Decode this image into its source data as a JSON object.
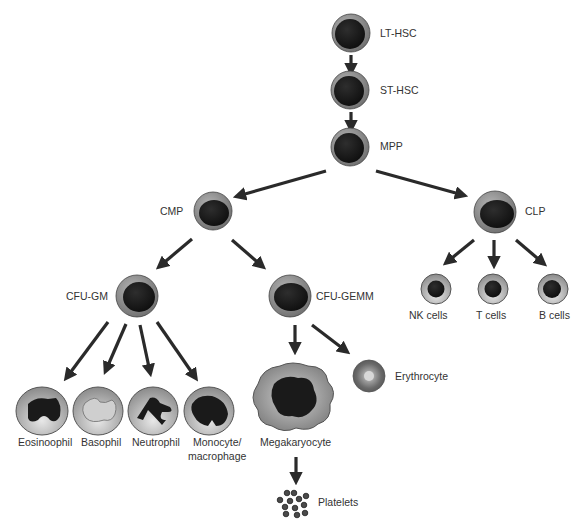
{
  "colors": {
    "arrow": "#2a2a2a",
    "cell_outer": "#7a7a7a",
    "cell_nucleus": "#1a1a1a",
    "label": "#333333"
  },
  "nodes": {
    "lt_hsc": {
      "label": "LT-HSC"
    },
    "st_hsc": {
      "label": "ST-HSC"
    },
    "mpp": {
      "label": "MPP"
    },
    "cmp": {
      "label": "CMP"
    },
    "clp": {
      "label": "CLP"
    },
    "cfu_gm": {
      "label": "CFU-GM"
    },
    "cfu_gemm": {
      "label": "CFU-GEMM"
    },
    "nk": {
      "label": "NK cells"
    },
    "t": {
      "label": "T cells"
    },
    "b": {
      "label": "B cells"
    },
    "eosinophil": {
      "label": "Eosinoophil"
    },
    "basophil": {
      "label": "Basophil"
    },
    "neutrophil": {
      "label": "Neutrophil"
    },
    "monocyte": {
      "label_line1": "Monocyte/",
      "label_line2": "macrophage"
    },
    "megakaryocyte": {
      "label": "Megakaryocyte"
    },
    "erythrocyte": {
      "label": "Erythrocyte"
    },
    "platelets": {
      "label": "Platelets"
    }
  },
  "edges": [
    [
      "LT-HSC",
      "ST-HSC"
    ],
    [
      "ST-HSC",
      "MPP"
    ],
    [
      "MPP",
      "CMP"
    ],
    [
      "MPP",
      "CLP"
    ],
    [
      "CMP",
      "CFU-GM"
    ],
    [
      "CMP",
      "CFU-GEMM"
    ],
    [
      "CLP",
      "NK cells"
    ],
    [
      "CLP",
      "T cells"
    ],
    [
      "CLP",
      "B cells"
    ],
    [
      "CFU-GM",
      "Eosinoophil"
    ],
    [
      "CFU-GM",
      "Basophil"
    ],
    [
      "CFU-GM",
      "Neutrophil"
    ],
    [
      "CFU-GM",
      "Monocyte/macrophage"
    ],
    [
      "CFU-GEMM",
      "Megakaryocyte"
    ],
    [
      "CFU-GEMM",
      "Erythrocyte"
    ],
    [
      "Megakaryocyte",
      "Platelets"
    ]
  ]
}
